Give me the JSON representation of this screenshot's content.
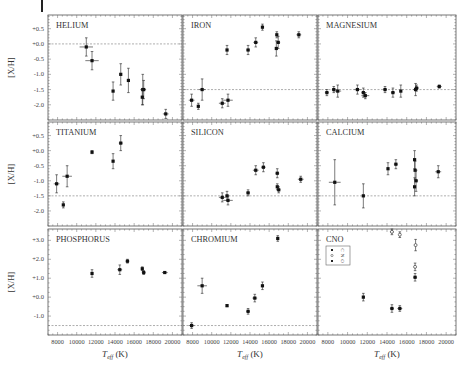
{
  "figure": {
    "ylabel": "[X/H]",
    "xlabel": "T_eff (K)",
    "xlabel_main": "T",
    "xlabel_sub": "eff",
    "xlabel_unit": " (K)",
    "xticks": [
      8000,
      10000,
      12000,
      14000,
      16000,
      18000,
      20000
    ],
    "xlim": [
      7000,
      21000
    ]
  },
  "rows": [
    {
      "yticks": [
        "+0.5",
        "+0.0",
        "-0.5",
        "-1.0",
        "-1.5",
        "-2.0"
      ],
      "yvals": [
        0.5,
        0.0,
        -0.5,
        -1.0,
        -1.5,
        -2.0
      ],
      "ylim": [
        -2.5,
        0.95
      ]
    },
    {
      "yticks": [
        "+0.5",
        "+0.0",
        "-0.5",
        "-1.0",
        "-1.5",
        "-2.0"
      ],
      "yvals": [
        0.5,
        0.0,
        -0.5,
        -1.0,
        -1.5,
        -2.0
      ],
      "ylim": [
        -2.5,
        0.95
      ]
    },
    {
      "yticks": [
        "+3.0",
        "+2.0",
        "+1.0",
        "+0.0",
        "-1.0"
      ],
      "yvals": [
        3.0,
        2.0,
        1.0,
        0.0,
        -1.0
      ],
      "ylim": [
        -2.0,
        3.6
      ]
    }
  ],
  "chart_data": [
    {
      "type": "scatter",
      "title": "HELIUM",
      "row": 0,
      "col": 0,
      "reference_line": 0.0,
      "xlabel": "T_eff (K)",
      "ylabel": "[X/H]",
      "points": [
        {
          "x": 11000,
          "y": -0.1,
          "xerr": 700,
          "yerr": 0.3
        },
        {
          "x": 11600,
          "y": -0.55,
          "xerr": 700,
          "yerr": 0.3
        },
        {
          "x": 13800,
          "y": -1.55,
          "xerr": 0,
          "yerr": 0.3
        },
        {
          "x": 14600,
          "y": -1.0,
          "xerr": 0,
          "yerr": 0.35
        },
        {
          "x": 15400,
          "y": -1.2,
          "xerr": 0,
          "yerr": 0.4
        },
        {
          "x": 16900,
          "y": -1.5,
          "xerr": 250,
          "yerr": 0.5
        },
        {
          "x": 17000,
          "y": -1.5,
          "xerr": 250,
          "yerr": 0.3
        },
        {
          "x": 16850,
          "y": -1.75,
          "xerr": 0,
          "yerr": 0.25
        },
        {
          "x": 19300,
          "y": -2.3,
          "xerr": 300,
          "yerr": 0.15
        }
      ]
    },
    {
      "type": "scatter",
      "title": "IRON",
      "row": 0,
      "col": 1,
      "reference_line": -1.5,
      "points": [
        {
          "x": 7900,
          "y": -1.85,
          "xerr": 300,
          "yerr": 0.2
        },
        {
          "x": 8600,
          "y": -2.05,
          "xerr": 0,
          "yerr": 0.1
        },
        {
          "x": 9000,
          "y": -1.5,
          "xerr": 350,
          "yerr": 0.35
        },
        {
          "x": 11100,
          "y": -1.95,
          "xerr": 350,
          "yerr": 0.15
        },
        {
          "x": 11700,
          "y": -1.85,
          "xerr": 500,
          "yerr": 0.2
        },
        {
          "x": 11600,
          "y": -0.2,
          "xerr": 0,
          "yerr": 0.15
        },
        {
          "x": 13800,
          "y": -0.2,
          "xerr": 200,
          "yerr": 0.15
        },
        {
          "x": 14600,
          "y": 0.05,
          "xerr": 250,
          "yerr": 0.15
        },
        {
          "x": 15300,
          "y": 0.55,
          "xerr": 0,
          "yerr": 0.1
        },
        {
          "x": 16800,
          "y": 0.3,
          "xerr": 0,
          "yerr": 0.1
        },
        {
          "x": 16950,
          "y": 0.05,
          "xerr": 200,
          "yerr": 0.2
        },
        {
          "x": 16750,
          "y": -0.15,
          "xerr": 0,
          "yerr": 0.25
        },
        {
          "x": 19100,
          "y": 0.3,
          "xerr": 250,
          "yerr": 0.1
        }
      ]
    },
    {
      "type": "scatter",
      "title": "MAGNESIUM",
      "row": 0,
      "col": 2,
      "reference_line": -1.5,
      "points": [
        {
          "x": 7900,
          "y": -1.6,
          "xerr": 200,
          "yerr": 0.1
        },
        {
          "x": 8600,
          "y": -1.5,
          "xerr": 200,
          "yerr": 0.1
        },
        {
          "x": 9000,
          "y": -1.55,
          "xerr": 350,
          "yerr": 0.2
        },
        {
          "x": 11000,
          "y": -1.5,
          "xerr": 300,
          "yerr": 0.15
        },
        {
          "x": 11600,
          "y": -1.6,
          "xerr": 200,
          "yerr": 0.15
        },
        {
          "x": 11800,
          "y": -1.7,
          "xerr": 400,
          "yerr": 0.1
        },
        {
          "x": 13800,
          "y": -1.5,
          "xerr": 200,
          "yerr": 0.1
        },
        {
          "x": 14600,
          "y": -1.6,
          "xerr": 200,
          "yerr": 0.15
        },
        {
          "x": 15400,
          "y": -1.55,
          "xerr": 0,
          "yerr": 0.2
        },
        {
          "x": 16900,
          "y": -1.5,
          "xerr": 250,
          "yerr": 0.2
        },
        {
          "x": 17000,
          "y": -1.45,
          "xerr": 250,
          "yerr": 0.1
        },
        {
          "x": 19300,
          "y": -1.4,
          "xerr": 250,
          "yerr": 0.05
        }
      ]
    },
    {
      "type": "scatter",
      "title": "TITANIUM",
      "row": 1,
      "col": 0,
      "reference_line": -1.5,
      "points": [
        {
          "x": 7900,
          "y": -1.1,
          "xerr": 300,
          "yerr": 0.3
        },
        {
          "x": 8600,
          "y": -1.8,
          "xerr": 0,
          "yerr": 0.1
        },
        {
          "x": 9000,
          "y": -0.85,
          "xerr": 500,
          "yerr": 0.35
        },
        {
          "x": 11600,
          "y": -0.05,
          "xerr": 0,
          "yerr": 0.05
        },
        {
          "x": 13800,
          "y": -0.35,
          "xerr": 0,
          "yerr": 0.25
        },
        {
          "x": 14600,
          "y": 0.25,
          "xerr": 200,
          "yerr": 0.25
        }
      ]
    },
    {
      "type": "scatter",
      "title": "SILICON",
      "row": 1,
      "col": 1,
      "reference_line": -1.5,
      "points": [
        {
          "x": 11100,
          "y": -1.55,
          "xerr": 350,
          "yerr": 0.15
        },
        {
          "x": 11600,
          "y": -1.5,
          "xerr": 0,
          "yerr": 0.15
        },
        {
          "x": 11700,
          "y": -1.65,
          "xerr": 500,
          "yerr": 0.15
        },
        {
          "x": 13800,
          "y": -1.4,
          "xerr": 200,
          "yerr": 0.1
        },
        {
          "x": 14600,
          "y": -0.65,
          "xerr": 300,
          "yerr": 0.15
        },
        {
          "x": 15400,
          "y": -0.55,
          "xerr": 250,
          "yerr": 0.15
        },
        {
          "x": 16850,
          "y": -0.75,
          "xerr": 200,
          "yerr": 0.15
        },
        {
          "x": 16850,
          "y": -1.2,
          "xerr": 0,
          "yerr": 0.1
        },
        {
          "x": 17000,
          "y": -1.3,
          "xerr": 200,
          "yerr": 0.1
        },
        {
          "x": 19300,
          "y": -0.95,
          "xerr": 300,
          "yerr": 0.1
        }
      ]
    },
    {
      "type": "scatter",
      "title": "CALCIUM",
      "row": 1,
      "col": 2,
      "reference_line": -1.5,
      "points": [
        {
          "x": 8700,
          "y": -1.05,
          "xerr": 600,
          "yerr": 0.75
        },
        {
          "x": 11600,
          "y": -1.5,
          "xerr": 0,
          "yerr": 0.4
        },
        {
          "x": 14100,
          "y": -0.6,
          "xerr": 0,
          "yerr": 0.2
        },
        {
          "x": 14900,
          "y": -0.45,
          "xerr": 200,
          "yerr": 0.15
        },
        {
          "x": 16800,
          "y": -0.3,
          "xerr": 0,
          "yerr": 0.3
        },
        {
          "x": 16850,
          "y": -0.65,
          "xerr": 0,
          "yerr": 0.3
        },
        {
          "x": 16950,
          "y": -1.0,
          "xerr": 200,
          "yerr": 0.35
        },
        {
          "x": 16800,
          "y": -1.2,
          "xerr": 0,
          "yerr": 0.3
        },
        {
          "x": 19200,
          "y": -0.7,
          "xerr": 300,
          "yerr": 0.2
        }
      ]
    },
    {
      "type": "scatter",
      "title": "PHOSPHORUS",
      "row": 2,
      "col": 0,
      "reference_line": -1.5,
      "points": [
        {
          "x": 11600,
          "y": 1.25,
          "xerr": 0,
          "yerr": 0.2
        },
        {
          "x": 14500,
          "y": 1.45,
          "xerr": 250,
          "yerr": 0.25
        },
        {
          "x": 15300,
          "y": 1.9,
          "xerr": 200,
          "yerr": 0.1
        },
        {
          "x": 16850,
          "y": 1.5,
          "xerr": 0,
          "yerr": 0.1
        },
        {
          "x": 17000,
          "y": 1.3,
          "xerr": 200,
          "yerr": 0.1
        },
        {
          "x": 19200,
          "y": 1.3,
          "xerr": 300,
          "yerr": 0.05
        }
      ]
    },
    {
      "type": "scatter",
      "title": "CHROMIUM",
      "row": 2,
      "col": 1,
      "reference_line": -1.5,
      "points": [
        {
          "x": 7900,
          "y": -1.5,
          "xerr": 300,
          "yerr": 0.15
        },
        {
          "x": 9000,
          "y": 0.6,
          "xerr": 500,
          "yerr": 0.4
        },
        {
          "x": 11600,
          "y": -0.45,
          "xerr": 0,
          "yerr": 0.05
        },
        {
          "x": 13800,
          "y": -0.75,
          "xerr": 200,
          "yerr": 0.15
        },
        {
          "x": 14500,
          "y": -0.05,
          "xerr": 250,
          "yerr": 0.2
        },
        {
          "x": 15300,
          "y": 0.6,
          "xerr": 0,
          "yerr": 0.2
        },
        {
          "x": 16900,
          "y": 3.1,
          "xerr": 0,
          "yerr": 0.15
        }
      ]
    },
    {
      "type": "scatter",
      "title": "CNO",
      "row": 2,
      "col": 2,
      "reference_line": null,
      "legend": {
        "position": "upper-left",
        "entries": [
          {
            "label": "C",
            "marker": "filled-square"
          },
          {
            "label": "N",
            "marker": "open-circle"
          },
          {
            "label": "O",
            "marker": "filled-diamond"
          }
        ]
      },
      "series": [
        {
          "name": "C",
          "marker": "filled",
          "points": [
            {
              "x": 11600,
              "y": 0.0,
              "xerr": 0,
              "yerr": 0.2
            },
            {
              "x": 14500,
              "y": -0.6,
              "xerr": 200,
              "yerr": 0.2
            },
            {
              "x": 15300,
              "y": -0.6,
              "xerr": 250,
              "yerr": 0.15
            },
            {
              "x": 16850,
              "y": 1.05,
              "xerr": 200,
              "yerr": 0.2
            }
          ]
        },
        {
          "name": "N",
          "marker": "open",
          "points": [
            {
              "x": 14500,
              "y": 3.45,
              "xerr": 200,
              "yerr": 0.15
            },
            {
              "x": 15300,
              "y": 3.3,
              "xerr": 0,
              "yerr": 0.15
            },
            {
              "x": 16900,
              "y": 2.75,
              "xerr": 0,
              "yerr": 0.3
            },
            {
              "x": 16850,
              "y": 1.6,
              "xerr": 0,
              "yerr": 0.2
            }
          ]
        }
      ]
    }
  ]
}
